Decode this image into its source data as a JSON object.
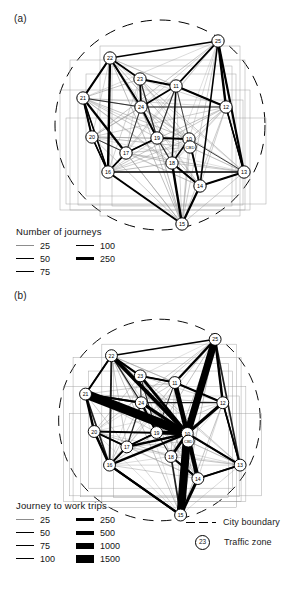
{
  "figure": {
    "panels": [
      {
        "id": "a",
        "label": "(a)",
        "legend": {
          "title": "Number of journeys",
          "columns": [
            {
              "items": [
                {
                  "value": "25",
                  "width": 0.4
                },
                {
                  "value": "50",
                  "width": 0.8
                },
                {
                  "value": "75",
                  "width": 1.2
                }
              ]
            },
            {
              "items": [
                {
                  "value": "100",
                  "width": 1.8
                },
                {
                  "value": "250",
                  "width": 3.0
                }
              ]
            }
          ]
        }
      },
      {
        "id": "b",
        "label": "(b)",
        "legend": {
          "title": "Journey to work trips",
          "columns": [
            {
              "items": [
                {
                  "value": "25",
                  "width": 0.4
                },
                {
                  "value": "50",
                  "width": 0.8
                },
                {
                  "value": "75",
                  "width": 1.2
                },
                {
                  "value": "100",
                  "width": 1.6
                }
              ]
            },
            {
              "items": [
                {
                  "value": "250",
                  "width": 2.4
                },
                {
                  "value": "500",
                  "width": 4.0
                },
                {
                  "value": "1000",
                  "width": 6.0
                },
                {
                  "value": "1500",
                  "width": 8.0
                }
              ]
            }
          ]
        }
      }
    ],
    "shared_legend": {
      "boundary_label": "City boundary",
      "zone_label": "Traffic zone",
      "zone_example": "23"
    },
    "colors": {
      "ink": "#000000",
      "faint_edge": "#9a9a9a",
      "mid_edge": "#4a4a4a",
      "background": "#ffffff"
    },
    "nodes": [
      {
        "id": "25",
        "x": 218,
        "y": 41
      },
      {
        "id": "22",
        "x": 110,
        "y": 58
      },
      {
        "id": "23",
        "x": 140,
        "y": 79
      },
      {
        "id": "11",
        "x": 176,
        "y": 86
      },
      {
        "id": "21",
        "x": 83,
        "y": 98
      },
      {
        "id": "12",
        "x": 226,
        "y": 107
      },
      {
        "id": "24",
        "x": 141,
        "y": 107
      },
      {
        "id": "20",
        "x": 92,
        "y": 137
      },
      {
        "id": "19",
        "x": 157,
        "y": 138
      },
      {
        "id": "10",
        "x": 189,
        "y": 139
      },
      {
        "id": "30",
        "x": 190,
        "y": 147
      },
      {
        "id": "17",
        "x": 126,
        "y": 153
      },
      {
        "id": "18",
        "x": 172,
        "y": 163
      },
      {
        "id": "16",
        "x": 108,
        "y": 172
      },
      {
        "id": "13",
        "x": 244,
        "y": 172
      },
      {
        "id": "14",
        "x": 200,
        "y": 186
      },
      {
        "id": "15",
        "x": 182,
        "y": 224
      }
    ],
    "cbd_label": "CBD",
    "boundary": {
      "cx": 160,
      "cy": 125,
      "r": 105
    }
  }
}
